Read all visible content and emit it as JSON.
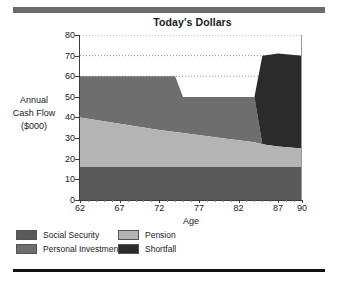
{
  "chart_data": {
    "type": "area",
    "title": "Today's Dollars",
    "xlabel": "Age",
    "ylabel": "Annual Cash Flow ($000)",
    "ylabel_lines": [
      "Annual",
      "Cash Flow",
      "($000)"
    ],
    "xlim": [
      62,
      90
    ],
    "ylim": [
      0,
      80
    ],
    "xticks": [
      62,
      67,
      72,
      77,
      82,
      87,
      90
    ],
    "yticks": [
      0,
      10,
      20,
      30,
      40,
      50,
      60,
      70,
      80
    ],
    "grid": "horizontal-dotted",
    "legend_position": "bottom-left",
    "stacked": true,
    "x": [
      62,
      67,
      72,
      74,
      75,
      80,
      84,
      85,
      87,
      90
    ],
    "series": [
      {
        "name": "Social Security",
        "color": "#595959",
        "values": [
          16,
          16,
          16,
          16,
          16,
          16,
          16,
          16,
          16,
          16
        ]
      },
      {
        "name": "Pension",
        "color": "#b4b4b4",
        "values": [
          24,
          21,
          18,
          17,
          16.5,
          14,
          12,
          11,
          10,
          9
        ]
      },
      {
        "name": "Personal Investments",
        "color": "#6e6e6e",
        "values": [
          20,
          23,
          26,
          27,
          17.5,
          20,
          22,
          0,
          0,
          0
        ]
      },
      {
        "name": "Shortfall",
        "color": "#2b2b2b",
        "values": [
          0,
          0,
          0,
          0,
          0,
          0,
          0,
          43,
          45,
          45
        ]
      }
    ],
    "stack_tops": {
      "total_line": [
        60,
        60,
        60,
        60,
        50,
        50,
        50,
        70,
        70,
        70
      ],
      "note": "Total cash flow need is 60 until age 74, drops to 50 from 75-84, rises to 70 from 85-90"
    }
  },
  "legend": {
    "items": [
      {
        "label": "Social Security",
        "color": "#595959"
      },
      {
        "label": "Pension",
        "color": "#b4b4b4"
      },
      {
        "label": "Personal Investments",
        "color": "#6e6e6e"
      },
      {
        "label": "Shortfall",
        "color": "#2b2b2b"
      }
    ]
  },
  "axes": {
    "ytick_labels": [
      "80",
      "70",
      "60",
      "50",
      "40",
      "30",
      "20",
      "10",
      "0"
    ],
    "xtick_labels": [
      "62",
      "67",
      "72",
      "77",
      "82",
      "87",
      "90"
    ]
  }
}
